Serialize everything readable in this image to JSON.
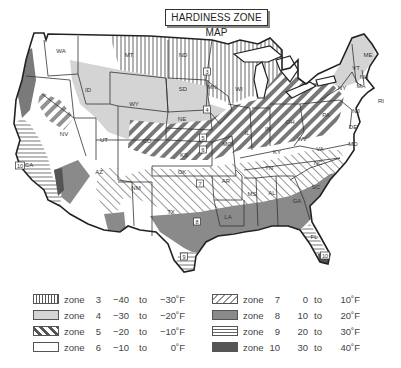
{
  "title": "HARDINESS ZONE MAP",
  "colors": {
    "zone3": "#555555",
    "zone4": "#d4d4d4",
    "zone5": "#555555",
    "zone6": "#ffffff",
    "zone7": "#999999",
    "zone8": "#8a8a8a",
    "zone9": "#666666",
    "zone10": "#555555",
    "outline": "#222222"
  },
  "state_labels": [
    {
      "id": "WA",
      "x": 61,
      "y": 53
    },
    {
      "id": "ID",
      "x": 88,
      "y": 92
    },
    {
      "id": "MT",
      "x": 129,
      "y": 57
    },
    {
      "id": "ND",
      "x": 183,
      "y": 57
    },
    {
      "id": "SD",
      "x": 183,
      "y": 91
    },
    {
      "id": "MN",
      "x": 212,
      "y": 89
    },
    {
      "id": "WI",
      "x": 239,
      "y": 91
    },
    {
      "id": "WY",
      "x": 134,
      "y": 106
    },
    {
      "id": "NE",
      "x": 182,
      "y": 121
    },
    {
      "id": "NV",
      "x": 64,
      "y": 136
    },
    {
      "id": "UT",
      "x": 104,
      "y": 142
    },
    {
      "id": "CO",
      "x": 147,
      "y": 143
    },
    {
      "id": "KS",
      "x": 184,
      "y": 157
    },
    {
      "id": "MO",
      "x": 227,
      "y": 146
    },
    {
      "id": "CA",
      "x": 29,
      "y": 167
    },
    {
      "id": "AZ",
      "x": 99,
      "y": 174
    },
    {
      "id": "NM",
      "x": 136,
      "y": 190
    },
    {
      "id": "OK",
      "x": 182,
      "y": 174
    },
    {
      "id": "AR",
      "x": 226,
      "y": 183
    },
    {
      "id": "TX",
      "x": 171,
      "y": 214
    },
    {
      "id": "LA",
      "x": 228,
      "y": 219
    },
    {
      "id": "MS",
      "x": 252,
      "y": 196
    },
    {
      "id": "AL",
      "x": 272,
      "y": 195
    },
    {
      "id": "GA",
      "x": 297,
      "y": 203
    },
    {
      "id": "SC",
      "x": 316,
      "y": 189
    },
    {
      "id": "NC",
      "x": 318,
      "y": 165
    },
    {
      "id": "TN",
      "x": 269,
      "y": 170
    },
    {
      "id": "KY",
      "x": 277,
      "y": 154
    },
    {
      "id": "VA",
      "x": 320,
      "y": 151
    },
    {
      "id": "WV",
      "x": 302,
      "y": 141
    },
    {
      "id": "OH",
      "x": 290,
      "y": 124
    },
    {
      "id": "IN",
      "x": 268,
      "y": 131
    },
    {
      "id": "IL",
      "x": 247,
      "y": 135
    },
    {
      "id": "PA",
      "x": 326,
      "y": 117
    },
    {
      "id": "FL",
      "x": 314,
      "y": 239
    },
    {
      "id": "NY",
      "x": 342,
      "y": 90
    },
    {
      "id": "ME",
      "x": 368,
      "y": 57
    },
    {
      "id": "VT",
      "x": 356,
      "y": 70
    },
    {
      "id": "NH",
      "x": 364,
      "y": 79
    },
    {
      "id": "MA",
      "x": 361,
      "y": 88
    },
    {
      "id": "RI",
      "x": 381,
      "y": 103
    },
    {
      "id": "NJ",
      "x": 356,
      "y": 113
    },
    {
      "id": "DE",
      "x": 353,
      "y": 129
    },
    {
      "id": "MD",
      "x": 353,
      "y": 146
    }
  ],
  "zone_markers": [
    {
      "label": "3",
      "x": 207,
      "y": 72
    },
    {
      "label": "4",
      "x": 207,
      "y": 110
    },
    {
      "label": "5",
      "x": 203,
      "y": 138
    },
    {
      "label": "6",
      "x": 203,
      "y": 150
    },
    {
      "label": "7",
      "x": 200,
      "y": 184
    },
    {
      "label": "8",
      "x": 197,
      "y": 222
    },
    {
      "label": "9",
      "x": 184,
      "y": 257
    },
    {
      "label": "10",
      "x": 20,
      "y": 166
    },
    {
      "label": "10",
      "x": 325,
      "y": 256
    }
  ],
  "legend": {
    "zone_word": "zone",
    "to_word": "to",
    "left": [
      {
        "zone": "3",
        "low": "−40",
        "high": "−30˚F",
        "swatch": "vertical-lines"
      },
      {
        "zone": "4",
        "low": "−30",
        "high": "−20˚F",
        "swatch": "light-gray"
      },
      {
        "zone": "5",
        "low": "−20",
        "high": "−10˚F",
        "swatch": "bold-diagonal"
      },
      {
        "zone": "6",
        "low": "−10",
        "high": "0˚F",
        "swatch": "white"
      }
    ],
    "right": [
      {
        "zone": "7",
        "low": "0",
        "high": "10˚F",
        "swatch": "thin-diagonal"
      },
      {
        "zone": "8",
        "low": "10",
        "high": "20˚F",
        "swatch": "medium-gray"
      },
      {
        "zone": "9",
        "low": "20",
        "high": "30˚F",
        "swatch": "horizontal-lines"
      },
      {
        "zone": "10",
        "low": "30",
        "high": "40˚F",
        "swatch": "dark-gray"
      }
    ]
  }
}
